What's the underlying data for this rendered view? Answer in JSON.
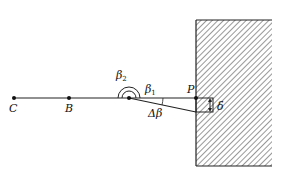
{
  "diagram": {
    "points": {
      "C": {
        "label": "C",
        "x": 14,
        "y": 98
      },
      "B": {
        "label": "B",
        "x": 69,
        "y": 98
      },
      "A": {
        "label": "",
        "x": 129,
        "y": 98
      },
      "P": {
        "label": "P",
        "x": 196,
        "y": 98
      }
    },
    "angles": {
      "beta2": {
        "symbol": "β",
        "sub": "2"
      },
      "beta1": {
        "symbol": "β",
        "sub": "1"
      },
      "delta_beta": {
        "label": "Δβ"
      }
    },
    "displacement": {
      "label": "δ"
    },
    "wall": {
      "x": 196,
      "y": 20,
      "width": 76,
      "height": 146,
      "hatch": "diagonal"
    },
    "colors": {
      "line": "#222222",
      "background": "#ffffff"
    }
  }
}
